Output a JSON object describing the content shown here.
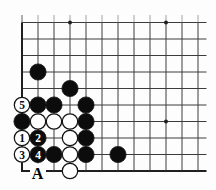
{
  "diagram": {
    "board": {
      "visible_columns": 12,
      "visible_rows": 10,
      "edges_visible": [
        "left",
        "bottom"
      ],
      "star_points": [
        {
          "col": 4,
          "row": 10
        },
        {
          "col": 10,
          "row": 10
        },
        {
          "col": 10,
          "row": 4
        }
      ],
      "stones": [
        {
          "col": 2,
          "row": 7,
          "color": "black"
        },
        {
          "col": 4,
          "row": 6,
          "color": "black"
        },
        {
          "col": 1,
          "row": 5,
          "color": "white",
          "number": "5"
        },
        {
          "col": 2,
          "row": 5,
          "color": "black"
        },
        {
          "col": 3,
          "row": 5,
          "color": "black"
        },
        {
          "col": 5,
          "row": 5,
          "color": "black"
        },
        {
          "col": 1,
          "row": 4,
          "color": "black"
        },
        {
          "col": 2,
          "row": 4,
          "color": "white"
        },
        {
          "col": 3,
          "row": 4,
          "color": "white"
        },
        {
          "col": 4,
          "row": 4,
          "color": "white"
        },
        {
          "col": 5,
          "row": 4,
          "color": "black"
        },
        {
          "col": 1,
          "row": 3,
          "color": "white",
          "number": "1"
        },
        {
          "col": 2,
          "row": 3,
          "color": "black",
          "number": "2"
        },
        {
          "col": 4,
          "row": 3,
          "color": "white"
        },
        {
          "col": 5,
          "row": 3,
          "color": "black"
        },
        {
          "col": 1,
          "row": 2,
          "color": "white",
          "number": "3"
        },
        {
          "col": 2,
          "row": 2,
          "color": "black",
          "number": "4"
        },
        {
          "col": 3,
          "row": 2,
          "color": "black"
        },
        {
          "col": 4,
          "row": 2,
          "color": "white"
        },
        {
          "col": 5,
          "row": 2,
          "color": "black"
        },
        {
          "col": 7,
          "row": 2,
          "color": "black"
        },
        {
          "col": 4,
          "row": 1,
          "color": "white"
        }
      ],
      "point_labels": [
        {
          "col": 2,
          "row": 1,
          "text": "A"
        }
      ]
    },
    "colors": {
      "background": "#fdfdfd",
      "grid_line": "#3c3c3c",
      "grid_line_faint_tip": "#9a9a9a",
      "board_edge": "#1f1f1f",
      "black_stone": "#0c0c0c",
      "white_stone": "#ffffff",
      "stone_outline": "#141414",
      "number_on_white": "#0c0c0c",
      "number_on_black": "#ffffff",
      "label_text": "#000000",
      "star_point": "#1f1f1f"
    }
  }
}
